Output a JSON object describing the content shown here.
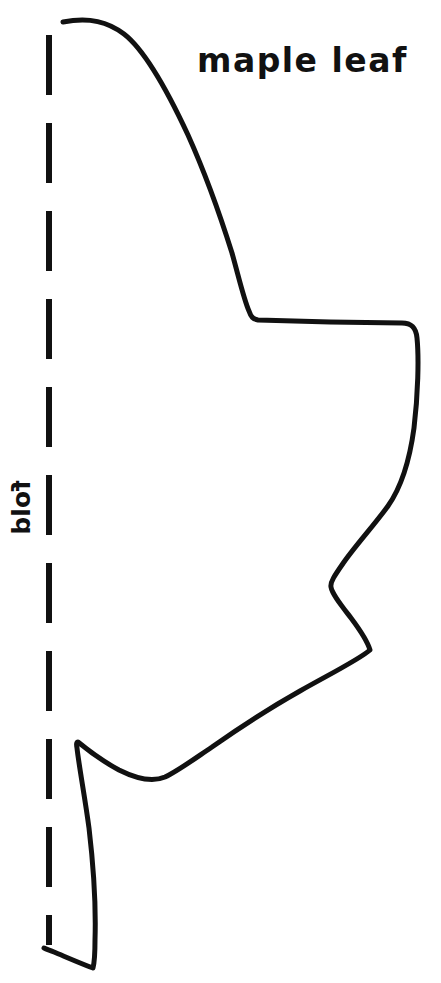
{
  "document": {
    "kind": "craft-template",
    "title": "maple leaf",
    "background_color": "#ffffff",
    "ink_color": "#111111"
  },
  "labels": {
    "title": "maple leaf",
    "fold": "fold"
  },
  "fold_line": {
    "orientation": "vertical",
    "x": 49,
    "y_start": 35,
    "y_end": 945,
    "dash_length": 60,
    "gap_length": 28,
    "stroke_width": 6,
    "color": "#111111"
  },
  "leaf_outline": {
    "name": "maple-leaf-half-outline",
    "stroke_width": 5,
    "color": "#111111",
    "fill": "none",
    "start_point": [
      63,
      22
    ],
    "end_point": [
      44,
      948
    ],
    "key_points": [
      [
        63,
        22
      ],
      [
        120,
        30
      ],
      [
        185,
        130
      ],
      [
        228,
        245
      ],
      [
        253,
        318
      ],
      [
        330,
        323
      ],
      [
        412,
        324
      ],
      [
        418,
        340
      ],
      [
        414,
        430
      ],
      [
        392,
        500
      ],
      [
        355,
        552
      ],
      [
        332,
        586
      ],
      [
        352,
        620
      ],
      [
        370,
        650
      ],
      [
        300,
        692
      ],
      [
        215,
        745
      ],
      [
        165,
        778
      ],
      [
        120,
        770
      ],
      [
        95,
        757
      ],
      [
        77,
        742
      ],
      [
        88,
        800
      ],
      [
        97,
        880
      ],
      [
        93,
        968
      ],
      [
        44,
        948
      ]
    ]
  }
}
